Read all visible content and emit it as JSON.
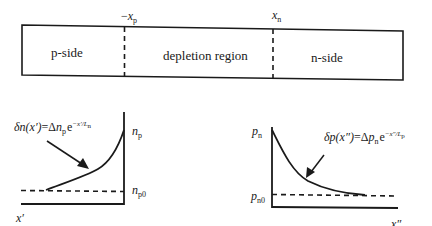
{
  "junction": {
    "regions": [
      {
        "label": "p-side"
      },
      {
        "label": "depletion region"
      },
      {
        "label": "n-side"
      }
    ],
    "boundaries": [
      {
        "sign": "−",
        "var": "x",
        "sub": "p"
      },
      {
        "sign": "",
        "var": "x",
        "sub": "n"
      }
    ]
  },
  "left_graph": {
    "formula": {
      "lhs": "δn(x′)",
      "eq": "=Δ",
      "n": "n",
      "n_sub": "p",
      "e": "e",
      "exp": "−x′/L",
      "exp_sub": "n"
    },
    "top_label": {
      "var": "n",
      "sub": "p"
    },
    "bottom_label": {
      "var": "n",
      "sub": "p0"
    },
    "x_axis_label": "x′"
  },
  "right_graph": {
    "formula": {
      "lhs": "δp(x″)",
      "eq": "=Δ",
      "p": "p",
      "p_sub": "n",
      "e": "e",
      "exp": "−x″/L",
      "exp_sub": "p"
    },
    "top_label": {
      "var": "p",
      "sub": "n"
    },
    "bottom_label": {
      "var": "p",
      "sub": "n0"
    },
    "x_axis_label": "x″"
  },
  "colors": {
    "stroke": "#1a1a1a",
    "background": "#ffffff"
  }
}
